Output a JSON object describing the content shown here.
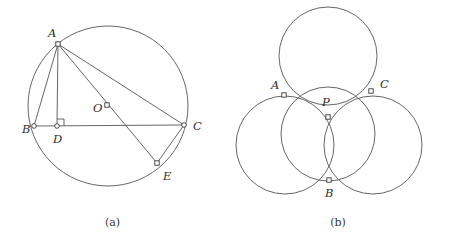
{
  "figure": {
    "stroke_color": "#555555",
    "marker_fill": "#ffffff",
    "label_color": "#2e2e2e",
    "background": "#ffffff"
  },
  "panel_a": {
    "caption": "(a)",
    "description": "Circle with center O and inscribed triangle ABC, altitude AD to BC, and diameter AE meeting the circle at E with chord EC",
    "circle": {
      "cx": 108,
      "cy": 106,
      "r": 80
    },
    "points": [
      {
        "name": "A",
        "label": "A",
        "x": 58,
        "y": 44,
        "label_x": 48,
        "label_y": 37,
        "marker": "square"
      },
      {
        "name": "B",
        "label": "B",
        "x": 34,
        "y": 126,
        "label_x": 22,
        "label_y": 133,
        "marker": "circle"
      },
      {
        "name": "C",
        "label": "C",
        "x": 184,
        "y": 125,
        "label_x": 193,
        "label_y": 130,
        "marker": "circle"
      },
      {
        "name": "D",
        "label": "D",
        "x": 57,
        "y": 126,
        "label_x": 53,
        "label_y": 143,
        "marker": "circle"
      },
      {
        "name": "E",
        "label": "E",
        "x": 157,
        "y": 163,
        "label_x": 163,
        "label_y": 180,
        "marker": "square"
      },
      {
        "name": "O",
        "label": "O",
        "x": 107,
        "y": 105,
        "label_x": 93,
        "label_y": 112,
        "marker": "square"
      }
    ],
    "segments": [
      {
        "name": "segment-AB",
        "from": "A",
        "to": "B"
      },
      {
        "name": "segment-AD",
        "from": "A",
        "to": "D"
      },
      {
        "name": "segment-AC",
        "from": "A",
        "to": "C"
      },
      {
        "name": "segment-AE",
        "from": "A",
        "to": "E"
      },
      {
        "name": "segment-BC",
        "from": "B",
        "to": "C"
      },
      {
        "name": "segment-CE",
        "from": "C",
        "to": "E"
      }
    ],
    "right_angle": {
      "at": "D",
      "size": 7,
      "orientation": "up-right"
    }
  },
  "panel_b": {
    "caption": "(b)",
    "description": "Four congruent circles: three outer circles pairwise intersecting at A, B, C and a central circle through A, B, C meeting the others at P",
    "circles": [
      {
        "name": "circle-top",
        "cx": 328,
        "cy": 56,
        "r": 49
      },
      {
        "name": "circle-left",
        "cx": 285,
        "cy": 145,
        "r": 49
      },
      {
        "name": "circle-right",
        "cx": 373,
        "cy": 145,
        "r": 49
      },
      {
        "name": "circle-center",
        "cx": 328,
        "cy": 134,
        "r": 47
      }
    ],
    "points": [
      {
        "name": "A",
        "label": "A",
        "x": 284,
        "y": 95,
        "label_x": 271,
        "label_y": 89,
        "marker": "square"
      },
      {
        "name": "C",
        "label": "C",
        "x": 371,
        "y": 91,
        "label_x": 380,
        "label_y": 88,
        "marker": "square"
      },
      {
        "name": "P",
        "label": "P",
        "x": 328,
        "y": 117,
        "label_x": 322,
        "label_y": 106,
        "marker": "square"
      },
      {
        "name": "B",
        "label": "B",
        "x": 329,
        "y": 180,
        "label_x": 325,
        "label_y": 197,
        "marker": "square"
      }
    ]
  }
}
